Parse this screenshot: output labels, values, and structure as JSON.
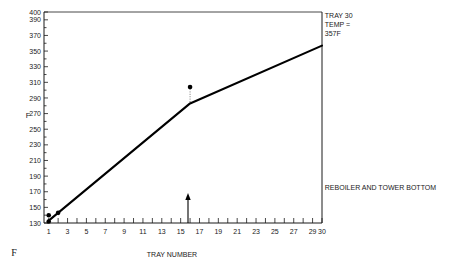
{
  "chart_data": {
    "type": "line",
    "title": "",
    "xlabel": "TRAY NUMBER",
    "ylabel": "F",
    "corner_unit": "F",
    "xlim": [
      0.5,
      30
    ],
    "ylim": [
      130,
      400
    ],
    "grid": false,
    "legend_position": "none",
    "x_ticks": [
      1,
      2,
      3,
      4,
      5,
      6,
      7,
      8,
      9,
      10,
      11,
      12,
      13,
      14,
      15,
      16,
      17,
      18,
      19,
      20,
      21,
      22,
      23,
      24,
      25,
      26,
      27,
      28,
      29,
      30
    ],
    "x_tick_labels": [
      "1",
      "3",
      "5",
      "7",
      "9",
      "11",
      "13",
      "15",
      "17",
      "19",
      "21",
      "23",
      "25",
      "27",
      "29",
      "30"
    ],
    "x_tick_label_values": [
      1,
      3,
      5,
      7,
      9,
      11,
      13,
      15,
      17,
      19,
      21,
      23,
      25,
      27,
      29,
      30
    ],
    "y_ticks": [
      130,
      140,
      150,
      160,
      170,
      180,
      190,
      200,
      210,
      220,
      230,
      240,
      250,
      260,
      270,
      280,
      290,
      300,
      310,
      320,
      330,
      340,
      350,
      360,
      370,
      380,
      390,
      400
    ],
    "y_tick_labels": [
      "130",
      "150",
      "170",
      "190",
      "210",
      "230",
      "250",
      "270",
      "290",
      "310",
      "330",
      "350",
      "370",
      "390",
      "400"
    ],
    "y_tick_label_values": [
      130,
      150,
      170,
      190,
      210,
      230,
      250,
      270,
      290,
      310,
      330,
      350,
      370,
      390,
      400
    ],
    "series": [
      {
        "name": "Tray temperature profile",
        "x": [
          1,
          16,
          30
        ],
        "values": [
          133,
          283,
          357
        ]
      }
    ],
    "points": [
      {
        "name": "point-tray1-low",
        "x": 1,
        "y": 132
      },
      {
        "name": "point-tray1-high",
        "x": 1,
        "y": 140
      },
      {
        "name": "point-tray2",
        "x": 2,
        "y": 143
      },
      {
        "name": "point-tray16-measured",
        "x": 16,
        "y": 304
      }
    ],
    "leader_line": {
      "x": 16,
      "y_from": 304,
      "y_to": 283
    },
    "axis_arrow": {
      "x": 16,
      "label": ""
    },
    "annotations": [
      {
        "name": "tray30-temp-note",
        "lines": [
          "TRAY 30",
          "TEMP =",
          "357F"
        ],
        "x": 30.3,
        "y": 392
      },
      {
        "name": "reboiler-note",
        "lines": [
          "REBOILER AND TOWER BOTTOM"
        ],
        "x": 30.3,
        "y": 172
      }
    ]
  }
}
